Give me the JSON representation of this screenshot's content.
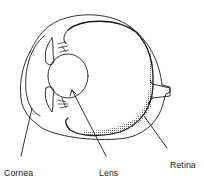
{
  "diagram": {
    "labels": {
      "cornea": "Cornea",
      "lens": "Lens",
      "retina": "Retina"
    },
    "colors": {
      "line": "#1a1a1a",
      "background": "#ffffff",
      "stipple": "#333333"
    }
  }
}
